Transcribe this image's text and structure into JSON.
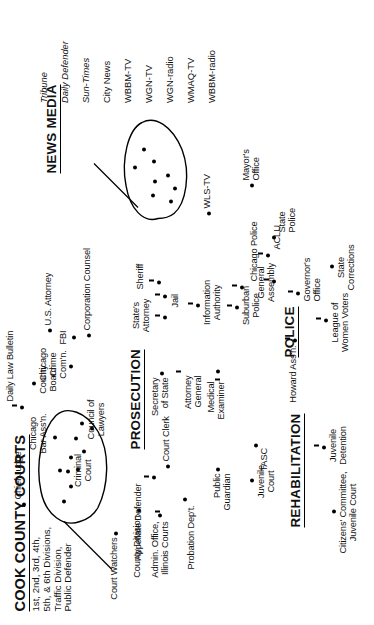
{
  "diagram": {
    "kind": "concept-map",
    "orientation": "rotated-90-ccw",
    "background_color": "#ffffff",
    "ink_color": "#000000"
  },
  "title": {
    "heading": "COOK COUNTY COURTS",
    "subtitle": "1st, 2nd, 3rd, 4th,\n5th, & 6th Divisions,\nTraffic Division,\nPublic Defender"
  },
  "sections": [
    {
      "id": "prosecution",
      "label": "PROSECUTION"
    },
    {
      "id": "police",
      "label": "POLICE"
    },
    {
      "id": "rehabilitation",
      "label": "REHABILITATION"
    },
    {
      "id": "news_media",
      "label": "NEWS MEDIA"
    }
  ],
  "news_media": {
    "label": "NEWS MEDIA",
    "outlets": [
      {
        "name": "Tribune",
        "style": "italic"
      },
      {
        "name": "Daily Defender",
        "style": "italic"
      },
      {
        "name": "Sun-Times",
        "style": "italic"
      },
      {
        "name": "City News",
        "style": "normal"
      },
      {
        "name": "WBBM-TV",
        "style": "normal"
      },
      {
        "name": "WGN-TV",
        "style": "normal"
      },
      {
        "name": "WGN-radio",
        "style": "normal"
      },
      {
        "name": "WMAQ-TV",
        "style": "normal"
      },
      {
        "name": "WBBM-radio",
        "style": "normal"
      }
    ],
    "outlets_text": "Tribune\nDaily Defender\nSun-Times\nCity News\nWBBM-TV\nWGN-TV\nWGN-radio\nWMAQ-TV\nWBBM-radio"
  },
  "clusters": [
    {
      "id": "courts-cluster",
      "node_count": 8,
      "label": "COOK COUNTY COURTS"
    },
    {
      "id": "news-media-cluster",
      "node_count": 8,
      "label": "NEWS MEDIA"
    }
  ],
  "nodes": [
    {
      "id": "chief-judge",
      "label": "Chief Judge"
    },
    {
      "id": "court-watchers",
      "label": "Court Watchers"
    },
    {
      "id": "county-division",
      "label": "County Division"
    },
    {
      "id": "criminal-court",
      "label": "Criminal\nCourt"
    },
    {
      "id": "appellate-defender",
      "label": "Appellate Defender"
    },
    {
      "id": "court-clerk",
      "label": "Court Clerk"
    },
    {
      "id": "admin-office",
      "label": "Admin. Office,\nIllinois Courts"
    },
    {
      "id": "probation-dept",
      "label": "Probation Dep't."
    },
    {
      "id": "chicago-bar-assn",
      "label": "Chicago\nBar Ass'n."
    },
    {
      "id": "council-of-lawyers",
      "label": "Council of\nLawyers"
    },
    {
      "id": "daily-law-bulletin",
      "label": "Daily Law Bulletin"
    },
    {
      "id": "county-board",
      "label": "County\nBoard"
    },
    {
      "id": "chicago-crime-comn",
      "label": "Chicago\nCrime\nCom'n."
    },
    {
      "id": "fbi",
      "label": "FBI"
    },
    {
      "id": "us-attorney",
      "label": "U.S. Attorney"
    },
    {
      "id": "corporation-counsel",
      "label": "Corporation Counsel"
    },
    {
      "id": "secretary-of-state",
      "label": "Secretary\nof State"
    },
    {
      "id": "attorney-general",
      "label": "Attorney\nGeneral"
    },
    {
      "id": "medical-examiner",
      "label": "Medical\nExaminer"
    },
    {
      "id": "wls-tv",
      "label": "WLS-TV"
    },
    {
      "id": "mayors-office",
      "label": "Mayor's\nOffice"
    },
    {
      "id": "state-police",
      "label": "State\nPolice"
    },
    {
      "id": "governors-office",
      "label": "Governor's\nOffice"
    },
    {
      "id": "states-attorney",
      "label": "State's\nAttorney"
    },
    {
      "id": "jail",
      "label": "Jail"
    },
    {
      "id": "sheriff",
      "label": "Sheriff"
    },
    {
      "id": "information-authority",
      "label": "Information\nAuthority"
    },
    {
      "id": "suburban-police",
      "label": "Suburban\nPolice"
    },
    {
      "id": "chicago-police",
      "label": "Chicago Police"
    },
    {
      "id": "aclu",
      "label": "ACLU"
    },
    {
      "id": "howard-assn",
      "label": "Howard Ass'n."
    },
    {
      "id": "general-assembly",
      "label": "General\nAssembly"
    },
    {
      "id": "league-women-voters",
      "label": "League of\nWomen Voters"
    },
    {
      "id": "state-corrections",
      "label": "State\nCorrections"
    },
    {
      "id": "tasc",
      "label": "TASC"
    },
    {
      "id": "juvenile-court",
      "label": "Juvenile\nCourt"
    },
    {
      "id": "public-guardian",
      "label": "Public\nGuardian"
    },
    {
      "id": "citizens-committee",
      "label": "Citizens' Committee,\nJuvenile Court"
    },
    {
      "id": "juvenile-detention",
      "label": "Juvenile\nDetention"
    }
  ]
}
